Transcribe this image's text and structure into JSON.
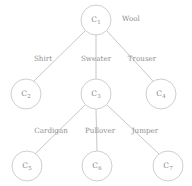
{
  "diagram": {
    "type": "tree",
    "title": "",
    "root_tag": {
      "text": "Wool",
      "x": 122,
      "y": 18
    },
    "nodes": [
      {
        "id": "c1",
        "label": "C",
        "subscript": "1",
        "cx": 96,
        "cy": 20,
        "r": 15
      },
      {
        "id": "c2",
        "label": "C",
        "subscript": "2",
        "cx": 26,
        "cy": 94,
        "r": 15
      },
      {
        "id": "c3",
        "label": "C",
        "subscript": "3",
        "cx": 96,
        "cy": 94,
        "r": 15
      },
      {
        "id": "c4",
        "label": "C",
        "subscript": "4",
        "cx": 161,
        "cy": 94,
        "r": 15
      },
      {
        "id": "c5",
        "label": "C",
        "subscript": "5",
        "cx": 27,
        "cy": 166,
        "r": 15
      },
      {
        "id": "c6",
        "label": "C",
        "subscript": "6",
        "cx": 97,
        "cy": 166,
        "r": 15
      },
      {
        "id": "c7",
        "label": "C",
        "subscript": "7",
        "cx": 168,
        "cy": 166,
        "r": 15
      }
    ],
    "edges": [
      {
        "id": "e-c1-c2",
        "from": "c1",
        "to": "c2",
        "x1": 85,
        "y1": 31,
        "x2": 34,
        "y2": 81,
        "label": "Shirt",
        "lx": 43,
        "ly": 58
      },
      {
        "id": "e-c1-c3",
        "from": "c1",
        "to": "c3",
        "x1": 96,
        "y1": 35,
        "x2": 96,
        "y2": 79,
        "label": "Sweater",
        "lx": 96,
        "ly": 58
      },
      {
        "id": "e-c1-c4",
        "from": "c1",
        "to": "c4",
        "x1": 107,
        "y1": 31,
        "x2": 153,
        "y2": 81,
        "label": "Trouser",
        "lx": 142,
        "ly": 58
      },
      {
        "id": "e-c3-c5",
        "from": "c3",
        "to": "c5",
        "x1": 85,
        "y1": 105,
        "x2": 35,
        "y2": 154,
        "label": "Cardigan",
        "lx": 51,
        "ly": 130
      },
      {
        "id": "e-c3-c6",
        "from": "c3",
        "to": "c6",
        "x1": 96,
        "y1": 109,
        "x2": 97,
        "y2": 151,
        "label": "Pullover",
        "lx": 100,
        "ly": 130
      },
      {
        "id": "e-c3-c7",
        "from": "c3",
        "to": "c7",
        "x1": 107,
        "y1": 105,
        "x2": 159,
        "y2": 154,
        "label": "Jumper",
        "lx": 145,
        "ly": 130
      }
    ],
    "colors": {
      "stroke": "#bdbdbd",
      "text": "#8f8f8f",
      "background": "#ffffff"
    }
  }
}
